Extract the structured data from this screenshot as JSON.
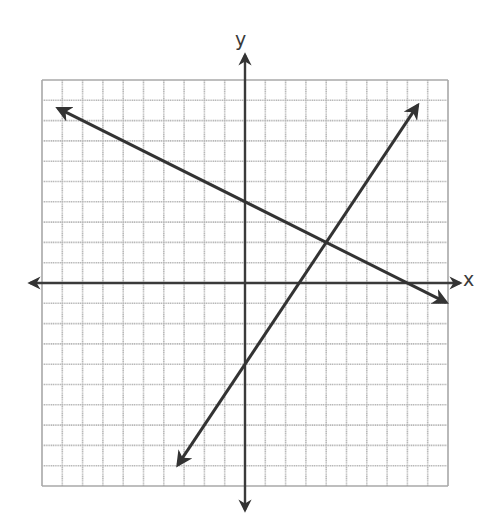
{
  "chart_data": {
    "type": "line",
    "title": "",
    "xlabel": "x",
    "ylabel": "y",
    "xlim": [
      -10,
      10
    ],
    "ylim": [
      -10,
      10
    ],
    "grid": true,
    "grid_step": 1,
    "legend": null,
    "series": [
      {
        "name": "line-decreasing",
        "equation": "y = -0.5x + 4",
        "slope": -0.5,
        "y_intercept": 4,
        "x_intercept": 8,
        "arrow_ends": true,
        "x": [
          -9.2,
          9.9
        ],
        "y": [
          8.6,
          -0.95
        ]
      },
      {
        "name": "line-increasing",
        "equation": "y = 1.5x - 4",
        "slope": 1.5,
        "y_intercept": -4,
        "x_intercept": 2.67,
        "arrow_ends": true,
        "x": [
          -3.3,
          8.5
        ],
        "y": [
          -8.95,
          8.75
        ]
      }
    ],
    "annotations": [
      {
        "type": "intersection",
        "x": 4,
        "y": 2
      }
    ]
  },
  "layout": {
    "origin_px": [
      245,
      283
    ],
    "unit_px": 20.3,
    "x_axis_px": [
      30,
      460
    ],
    "y_axis_px": [
      55,
      510
    ]
  },
  "colors": {
    "grid": "#b8b8b8",
    "grid_border": "#a8a8a8",
    "axis": "#3a3a3a",
    "line": "#333333"
  }
}
